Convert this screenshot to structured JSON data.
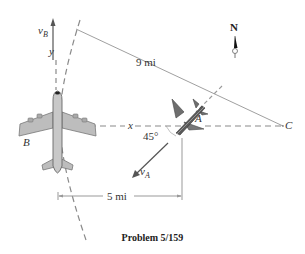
{
  "figure": {
    "caption": "Problem 5/159",
    "compass": {
      "label": "N"
    },
    "labels": {
      "vB": "v",
      "vB_sub": "B",
      "y_axis": "y",
      "x_axis": "x",
      "plane_B": "B",
      "plane_A": "A",
      "point_C": "C",
      "vA": "v",
      "vA_sub": "A",
      "angle": "45°",
      "distance_BC": "9 mi",
      "distance_horizontal": "5 mi"
    },
    "colors": {
      "plane_body": "#b8b8b8",
      "jet_body": "#6e6e6e",
      "dashed_lines": "#8a8a8a",
      "dimension_lines": "#999999"
    }
  }
}
